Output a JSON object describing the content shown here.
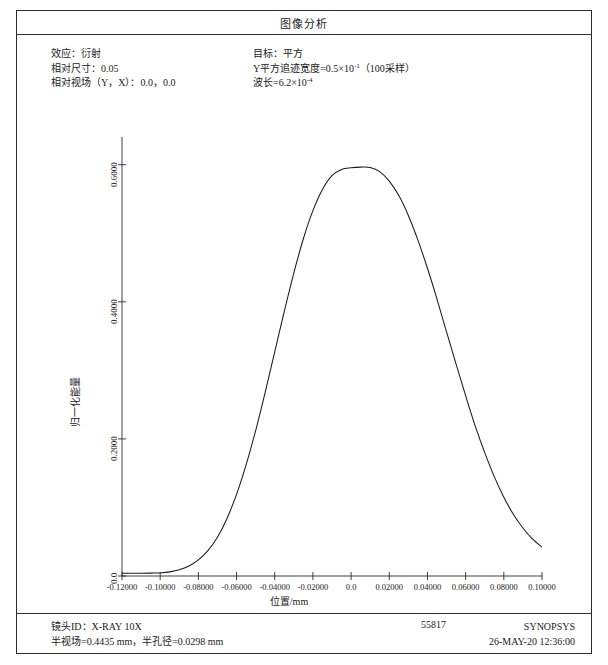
{
  "window": {
    "title": "图像分析"
  },
  "header": {
    "left": [
      "效应：衍射",
      "相对尺寸：0.05",
      "相对视场（Y，X）：0.0，0.0"
    ],
    "right": {
      "target_label": "目标：平方",
      "trace_width_label": "Y平方追迹宽度=0.5×10",
      "trace_width_exp": "-1",
      "trace_width_tail": "（100采样）",
      "wavelength_label": "波长=6.2×10",
      "wavelength_exp": "-4"
    }
  },
  "chart_data": {
    "type": "line",
    "title": "图像分析",
    "xlabel": "位置/mm",
    "ylabel": "归一化能量",
    "xlim": [
      -0.12,
      0.1
    ],
    "ylim": [
      0.0,
      0.62
    ],
    "grid": false,
    "legend": "none",
    "line_color": "#1a1a1a",
    "xticks": [
      -0.12,
      -0.1,
      -0.08,
      -0.06,
      -0.04,
      -0.02,
      0.0,
      0.02,
      0.04,
      0.06,
      0.08,
      0.1
    ],
    "xtick_labels": [
      "-0.12000",
      "-0.10000",
      "-0.08000",
      "-0.06000",
      "-0.04000",
      "-0.02000",
      "0.0",
      "0.02000",
      "0.04000",
      "0.06000",
      "0.08000",
      "0.10000"
    ],
    "yticks": [
      0.0,
      0.2,
      0.4,
      0.6
    ],
    "ytick_labels": [
      "0.0",
      "0.2000",
      "0.4000",
      "0.6000"
    ],
    "series": [
      {
        "name": "归一化能量",
        "x": [
          -0.12,
          -0.115,
          -0.11,
          -0.105,
          -0.1,
          -0.095,
          -0.09,
          -0.085,
          -0.08,
          -0.075,
          -0.07,
          -0.065,
          -0.06,
          -0.055,
          -0.05,
          -0.045,
          -0.04,
          -0.035,
          -0.03,
          -0.025,
          -0.02,
          -0.015,
          -0.01,
          -0.005,
          0.0,
          0.005,
          0.01,
          0.015,
          0.02,
          0.025,
          0.03,
          0.035,
          0.04,
          0.045,
          0.05,
          0.055,
          0.06,
          0.065,
          0.07,
          0.075,
          0.08,
          0.085,
          0.09,
          0.095,
          0.1
        ],
        "y": [
          0.004,
          0.004,
          0.004,
          0.0042,
          0.0045,
          0.006,
          0.009,
          0.0145,
          0.0235,
          0.037,
          0.0565,
          0.084,
          0.119,
          0.162,
          0.212,
          0.268,
          0.327,
          0.386,
          0.442,
          0.492,
          0.533,
          0.564,
          0.584,
          0.593,
          0.5955,
          0.5965,
          0.596,
          0.59,
          0.576,
          0.555,
          0.526,
          0.49,
          0.449,
          0.404,
          0.356,
          0.309,
          0.263,
          0.219,
          0.18,
          0.145,
          0.115,
          0.09,
          0.07,
          0.054,
          0.042
        ]
      }
    ]
  },
  "footer": {
    "lens_id": "镜头ID：X-RAY 10X",
    "field_aperture": "半视场=0.4435 mm，半孔径=0.0298 mm",
    "serial": "55817",
    "vendor": "SYNOPSYS",
    "timestamp": "26-MAY-20 12:36:00"
  }
}
